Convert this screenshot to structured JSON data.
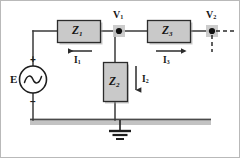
{
  "figure": {
    "kind": "circuit-diagram",
    "background": "#ffffff",
    "border_color": "#b4b4b4"
  },
  "palette": {
    "wire": "#3a3a3a",
    "component_fill": "#c9c9c9",
    "component_stroke": "#2b2b2b",
    "shadow": "#9a9a9a",
    "ground_bus": "#c0c0c0",
    "ground_bus_line": "#4a4a4a",
    "node_dot": "#111111",
    "node_highlight": "#c6c6c6",
    "text": "#161616",
    "dashed": "#2b2b2b"
  },
  "source": {
    "name": "E",
    "label": "E",
    "type": "ac-voltage-source",
    "plus_sign": "+",
    "minus_sign": "−",
    "symbol": "sine-wave"
  },
  "impedances": [
    {
      "id": "Z1",
      "label": "Z",
      "subscript": "1",
      "orientation": "horizontal"
    },
    {
      "id": "Z2",
      "label": "Z",
      "subscript": "2",
      "orientation": "vertical"
    },
    {
      "id": "Z3",
      "label": "Z",
      "subscript": "3",
      "orientation": "horizontal"
    }
  ],
  "currents": [
    {
      "id": "I1",
      "label": "I",
      "subscript": "1",
      "direction": "left"
    },
    {
      "id": "I2",
      "label": "I",
      "subscript": "2",
      "direction": "down"
    },
    {
      "id": "I3",
      "label": "I",
      "subscript": "3",
      "direction": "right"
    }
  ],
  "nodes": [
    {
      "id": "V1",
      "label": "V",
      "subscript": "1",
      "highlighted": true
    },
    {
      "id": "V2",
      "label": "V",
      "subscript": "2",
      "highlighted": true
    }
  ],
  "ground": {
    "label": "ground",
    "symbol": "earth-ground"
  }
}
